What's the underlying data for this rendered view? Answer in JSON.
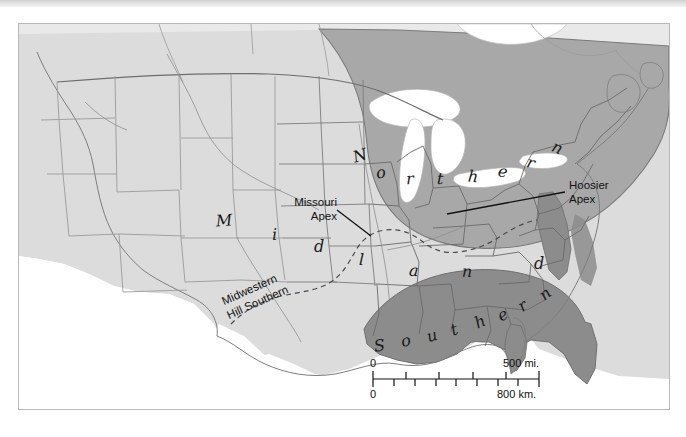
{
  "map": {
    "title": "Dialect regions of the United States",
    "region_labels": [
      {
        "name": "northern",
        "text": "Northern",
        "letters": [
          "N",
          "o",
          "r",
          "t",
          "h",
          "e",
          "r",
          "n"
        ]
      },
      {
        "name": "midland",
        "text": "Midland",
        "letters": [
          "M",
          "i",
          "d",
          "l",
          "a",
          "n",
          "d"
        ]
      },
      {
        "name": "southern",
        "text": "Southern",
        "letters": [
          "S",
          "o",
          "u",
          "t",
          "h",
          "e",
          "r",
          "n"
        ]
      }
    ],
    "callouts": [
      {
        "name": "missouri-apex",
        "line1": "Missouri",
        "line2": "Apex"
      },
      {
        "name": "hoosier-apex",
        "line1": "Hoosier",
        "line2": "Apex"
      }
    ],
    "boundary_labels": [
      {
        "name": "midwestern",
        "text": "Midwestern"
      },
      {
        "name": "hill-southern",
        "text": "Hill Southern"
      }
    ],
    "scale": {
      "miles_start": "0",
      "miles_end": "500 mi.",
      "km_start": "0",
      "km_end": "800 km."
    },
    "colors": {
      "northern_fill": "#a8a8a8",
      "midland_fill": "#dcdcdc",
      "southern_fill": "#8c8c8c",
      "water": "#ffffff",
      "land_outline": "#6e6e6e",
      "state_line": "#8a8a8a",
      "frame": "#b9b9b9",
      "text": "#111111"
    }
  }
}
